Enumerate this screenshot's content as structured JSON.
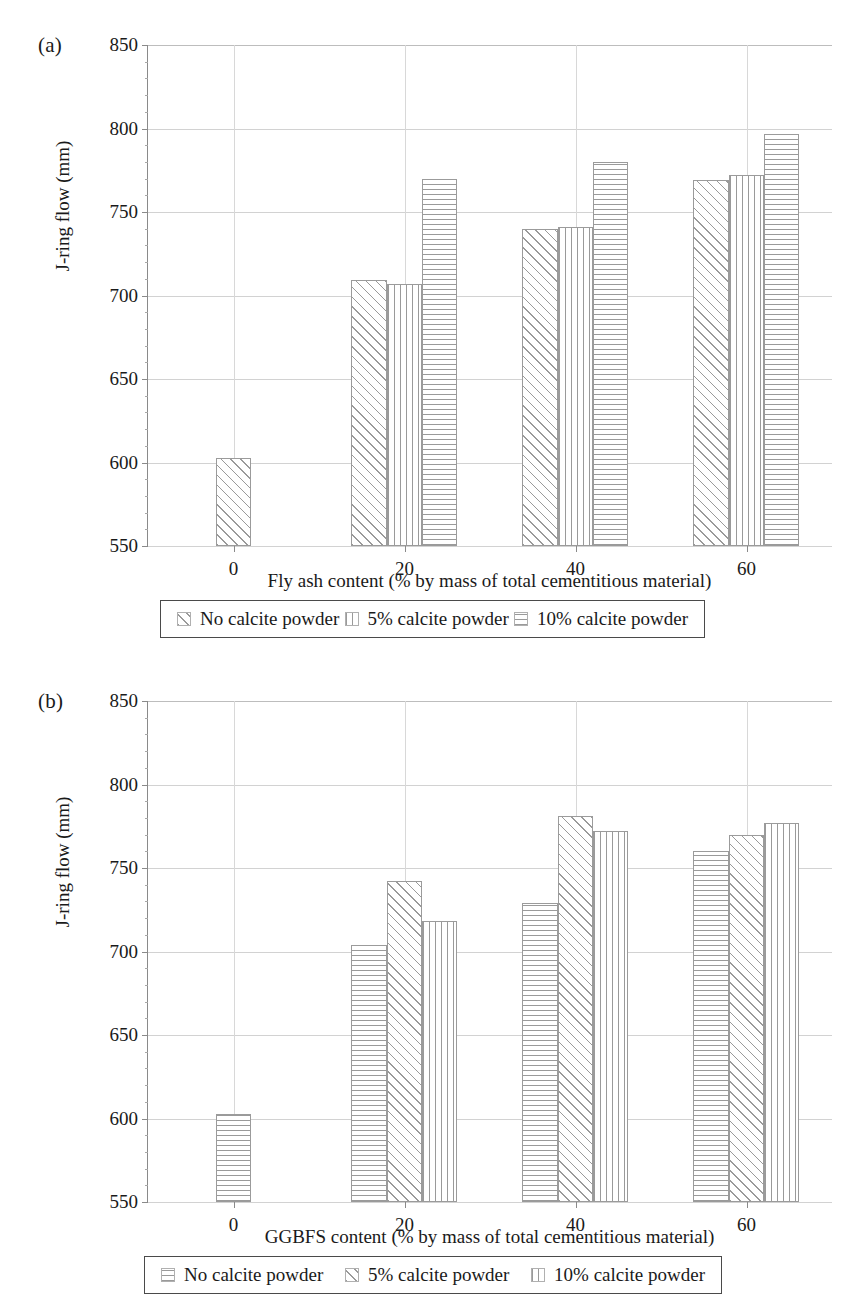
{
  "chart_data": [
    {
      "type": "bar",
      "panel": "(a)",
      "title": "",
      "xlabel": "Fly ash content (% by mass of total cementitious material)",
      "ylabel": "J-ring flow (mm)",
      "categories": [
        "0",
        "20",
        "40",
        "60"
      ],
      "ylim": [
        550,
        850
      ],
      "yticks": [
        550,
        600,
        650,
        700,
        750,
        800,
        850
      ],
      "grid": true,
      "legend_position": "below-axis",
      "series": [
        {
          "name": "No calcite powder",
          "pattern": "diagonal",
          "values": [
            603,
            709,
            740,
            769
          ]
        },
        {
          "name": "5% calcite powder",
          "pattern": "vertical",
          "values": [
            null,
            707,
            741,
            772
          ]
        },
        {
          "name": "10% calcite powder",
          "pattern": "horizontal",
          "values": [
            null,
            770,
            780,
            797
          ]
        }
      ]
    },
    {
      "type": "bar",
      "panel": "(b)",
      "title": "",
      "xlabel": "GGBFS content (% by mass of total cementitious material)",
      "ylabel": "J-ring flow (mm)",
      "categories": [
        "0",
        "20",
        "40",
        "60"
      ],
      "ylim": [
        550,
        850
      ],
      "yticks": [
        550,
        600,
        650,
        700,
        750,
        800,
        850
      ],
      "grid": true,
      "legend_position": "below-axis",
      "series": [
        {
          "name": "No calcite powder",
          "pattern": "horizontal",
          "values": [
            603,
            704,
            729,
            760
          ]
        },
        {
          "name": "5% calcite powder",
          "pattern": "diagonal",
          "values": [
            null,
            742,
            781,
            770
          ]
        },
        {
          "name": "10% calcite powder",
          "pattern": "vertical",
          "values": [
            null,
            718,
            772,
            777
          ]
        }
      ]
    }
  ],
  "figures": {
    "a": {
      "panel_label": "(a)",
      "ylabel": "J-ring flow (mm)",
      "xlabel": "Fly ash content (% by mass of total cementitious material)",
      "yticks": [
        "850",
        "800",
        "750",
        "700",
        "650",
        "600",
        "550"
      ],
      "xticks": [
        "0",
        "20",
        "40",
        "60"
      ],
      "legend": [
        {
          "label": "No calcite powder",
          "pattern": "diagonal"
        },
        {
          "label": "5% calcite powder",
          "pattern": "vertical"
        },
        {
          "label": "10% calcite powder",
          "pattern": "horizontal"
        }
      ]
    },
    "b": {
      "panel_label": "(b)",
      "ylabel": "J-ring flow (mm)",
      "xlabel": "GGBFS content (% by mass of total cementitious material)",
      "yticks": [
        "850",
        "800",
        "750",
        "700",
        "650",
        "600",
        "550"
      ],
      "xticks": [
        "0",
        "20",
        "40",
        "60"
      ],
      "legend": [
        {
          "label": "No calcite powder",
          "pattern": "horizontal"
        },
        {
          "label": "5% calcite powder",
          "pattern": "diagonal"
        },
        {
          "label": "10% calcite powder",
          "pattern": "vertical"
        }
      ]
    }
  },
  "colors": {
    "hatch": "#9a9a9a",
    "axis": "#8a8a8a",
    "grid": "#d2d2d2",
    "text": "#1a1a1a",
    "legend_border": "#4a4a4a"
  }
}
